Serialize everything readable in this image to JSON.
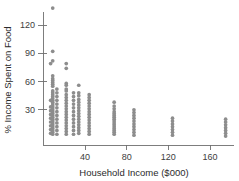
{
  "chart_data": {
    "type": "scatter",
    "title": "",
    "xlabel": "Household Income ($000)",
    "ylabel": "% Income Spent on Food",
    "xlim": [
      0,
      185
    ],
    "ylim": [
      0,
      140
    ],
    "xticks": [
      40,
      80,
      120,
      160
    ],
    "yticks": [
      30,
      60,
      90,
      120
    ],
    "grid": false,
    "legend": null,
    "marker_color": "#8d8d8d",
    "axis_color": "#6f6f6f",
    "series": [
      {
        "name": "Households",
        "points": [
          [
            9,
            138
          ],
          [
            9,
            92
          ],
          [
            7,
            79
          ],
          [
            9,
            82
          ],
          [
            22,
            79
          ],
          [
            22,
            74
          ],
          [
            9,
            66
          ],
          [
            9,
            63
          ],
          [
            9,
            61
          ],
          [
            9,
            59
          ],
          [
            9,
            57
          ],
          [
            9,
            55
          ],
          [
            22,
            58
          ],
          [
            22,
            56
          ],
          [
            22,
            52
          ],
          [
            22,
            50
          ],
          [
            34,
            56
          ],
          [
            34,
            48
          ],
          [
            34,
            45
          ],
          [
            9,
            50
          ],
          [
            9,
            48
          ],
          [
            9,
            46
          ],
          [
            9,
            44
          ],
          [
            9,
            42
          ],
          [
            9,
            40
          ],
          [
            9,
            38
          ],
          [
            9,
            36
          ],
          [
            9,
            34
          ],
          [
            9,
            32
          ],
          [
            9,
            30
          ],
          [
            9,
            28
          ],
          [
            9,
            26
          ],
          [
            9,
            24
          ],
          [
            9,
            22
          ],
          [
            9,
            20
          ],
          [
            9,
            18
          ],
          [
            9,
            16
          ],
          [
            9,
            14
          ],
          [
            9,
            12
          ],
          [
            9,
            10
          ],
          [
            9,
            8
          ],
          [
            9,
            6
          ],
          [
            9,
            4
          ],
          [
            7,
            40
          ],
          [
            7,
            33
          ],
          [
            7,
            29
          ],
          [
            7,
            25
          ],
          [
            7,
            21
          ],
          [
            7,
            17
          ],
          [
            7,
            13
          ],
          [
            7,
            9
          ],
          [
            7,
            5
          ],
          [
            13,
            52
          ],
          [
            13,
            48
          ],
          [
            13,
            44
          ],
          [
            13,
            40
          ],
          [
            13,
            36
          ],
          [
            13,
            32
          ],
          [
            13,
            28
          ],
          [
            13,
            24
          ],
          [
            13,
            20
          ],
          [
            13,
            16
          ],
          [
            13,
            12
          ],
          [
            13,
            8
          ],
          [
            13,
            4
          ],
          [
            22,
            46
          ],
          [
            22,
            43
          ],
          [
            22,
            40
          ],
          [
            22,
            37
          ],
          [
            22,
            34
          ],
          [
            22,
            31
          ],
          [
            22,
            28
          ],
          [
            22,
            25
          ],
          [
            22,
            22
          ],
          [
            22,
            19
          ],
          [
            22,
            16
          ],
          [
            22,
            13
          ],
          [
            22,
            10
          ],
          [
            22,
            7
          ],
          [
            22,
            4
          ],
          [
            29,
            48
          ],
          [
            29,
            44
          ],
          [
            29,
            40
          ],
          [
            29,
            36
          ],
          [
            29,
            32
          ],
          [
            29,
            28
          ],
          [
            29,
            24
          ],
          [
            29,
            20
          ],
          [
            29,
            16
          ],
          [
            29,
            12
          ],
          [
            29,
            8
          ],
          [
            29,
            4
          ],
          [
            34,
            41
          ],
          [
            34,
            38
          ],
          [
            34,
            35
          ],
          [
            34,
            32
          ],
          [
            34,
            29
          ],
          [
            34,
            26
          ],
          [
            34,
            23
          ],
          [
            34,
            20
          ],
          [
            34,
            17
          ],
          [
            34,
            14
          ],
          [
            34,
            11
          ],
          [
            34,
            8
          ],
          [
            34,
            5
          ],
          [
            44,
            46
          ],
          [
            44,
            43
          ],
          [
            44,
            40
          ],
          [
            44,
            37
          ],
          [
            44,
            34
          ],
          [
            44,
            31
          ],
          [
            44,
            28
          ],
          [
            44,
            25
          ],
          [
            44,
            22
          ],
          [
            44,
            19
          ],
          [
            44,
            16
          ],
          [
            44,
            13
          ],
          [
            44,
            10
          ],
          [
            44,
            7
          ],
          [
            44,
            4
          ],
          [
            68,
            38
          ],
          [
            68,
            34
          ],
          [
            68,
            31
          ],
          [
            68,
            28
          ],
          [
            68,
            26
          ],
          [
            68,
            24
          ],
          [
            68,
            22
          ],
          [
            68,
            20
          ],
          [
            68,
            18
          ],
          [
            68,
            16
          ],
          [
            68,
            14
          ],
          [
            68,
            12
          ],
          [
            68,
            10
          ],
          [
            68,
            8
          ],
          [
            68,
            6
          ],
          [
            68,
            4
          ],
          [
            87,
            30
          ],
          [
            87,
            27
          ],
          [
            87,
            24
          ],
          [
            87,
            21
          ],
          [
            87,
            18
          ],
          [
            87,
            15
          ],
          [
            87,
            12
          ],
          [
            87,
            9
          ],
          [
            87,
            6
          ],
          [
            87,
            3
          ],
          [
            124,
            21
          ],
          [
            124,
            18
          ],
          [
            124,
            15
          ],
          [
            124,
            12
          ],
          [
            124,
            9
          ],
          [
            124,
            6
          ],
          [
            124,
            3
          ],
          [
            175,
            20
          ],
          [
            175,
            17
          ],
          [
            175,
            14
          ],
          [
            175,
            11
          ],
          [
            175,
            8
          ],
          [
            175,
            5
          ],
          [
            175,
            2
          ]
        ]
      }
    ]
  }
}
